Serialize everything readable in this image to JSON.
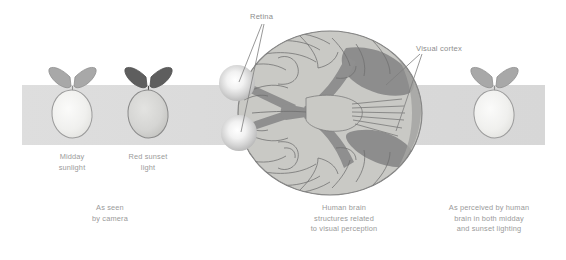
{
  "figure": {
    "title_text": "",
    "background_color": "#ffffff",
    "band": {
      "name": "lighting-band",
      "color_left": "#dcdcdc",
      "color_right": "#d8d8d8",
      "x": 22,
      "y": 85,
      "width": 523,
      "height": 60
    }
  },
  "annotations": [
    {
      "id": "retina",
      "label": "Retina",
      "label_x": 250,
      "label_y": 12,
      "color": "#8d8d8d",
      "targets": [
        {
          "x": 239,
          "y": 82
        },
        {
          "x": 241,
          "y": 132
        }
      ]
    },
    {
      "id": "visual-cortex",
      "label": "Visual cortex",
      "label_x": 416,
      "label_y": 44,
      "color": "#8d8d8d",
      "targets": [
        {
          "x": 386,
          "y": 85
        },
        {
          "x": 396,
          "y": 131
        }
      ]
    }
  ],
  "specimens": [
    {
      "id": "lemon-midday-camera",
      "name": "lemon-midday",
      "x": 72,
      "y": 112,
      "body_fill": "#f0f0ee",
      "body_stroke": "#9b9b9b",
      "leaf_fill": "#a8a8a8",
      "leaf_stroke": "#8e8e8e",
      "caption": "Midday\nsunlight",
      "caption_x": 72,
      "caption_y": 152
    },
    {
      "id": "lemon-sunset-camera",
      "name": "lemon-red-sunset",
      "x": 148,
      "y": 112,
      "body_fill": "#d5d5d3",
      "body_stroke": "#8a8a8a",
      "leaf_fill": "#5e5e5e",
      "leaf_stroke": "#4e4e4e",
      "caption": "Red sunset\nlight",
      "caption_x": 148,
      "caption_y": 152
    },
    {
      "id": "lemon-perceived",
      "name": "lemon-perceived",
      "x": 494,
      "y": 112,
      "body_fill": "#f0f0ee",
      "body_stroke": "#9b9b9b",
      "leaf_fill": "#a8a8a8",
      "leaf_stroke": "#8e8e8e",
      "caption": "",
      "caption_x": 494,
      "caption_y": 152
    }
  ],
  "captions": {
    "camera": {
      "text": "As seen\nby camera",
      "x": 110,
      "y": 208
    },
    "brain": {
      "text": "Human brain\nstructures related\nto visual perception",
      "x": 344,
      "y": 208
    },
    "perceived": {
      "text": "As perceived by human\nbrain in both midday\nand sunset lighting",
      "x": 489,
      "y": 208
    }
  },
  "brain": {
    "name": "human-brain-ventral-view",
    "outline_fill": "#c9c9c5",
    "outline_stroke": "#7e7e7e",
    "pathway_fill": "#8f8f8f",
    "sulci_stroke": "#6f6f6f",
    "cortex_fill": "#888888",
    "center_x": 330,
    "center_y": 113,
    "rx": 92,
    "ry": 82,
    "eyes": [
      {
        "name": "eyeball-upper",
        "cx": 237,
        "cy": 83,
        "r": 18
      },
      {
        "name": "eyeball-lower",
        "cx": 239,
        "cy": 133,
        "r": 18
      }
    ]
  }
}
